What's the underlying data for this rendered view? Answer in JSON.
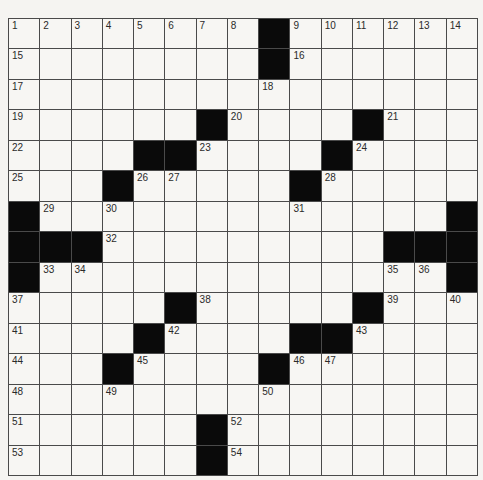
{
  "puzzle": {
    "rows": 15,
    "cols": 15,
    "colors": {
      "black_square": "#0a0a0a",
      "white_square": "#f7f6f3",
      "grid_line": "#4a4a4a",
      "number_text": "#2a2a2a"
    },
    "layout": [
      "........#......",
      "........#......",
      "...............",
      "......#....#...",
      "....##....#....",
      "...#.....#.....",
      "#.............#",
      "###.........###",
      "#.............#",
      ".....#.....#...",
      "....#....##....",
      "...#....#......",
      "...............",
      "......#........",
      "......#........"
    ],
    "numbers": [
      {
        "n": "1",
        "r": 0,
        "c": 0
      },
      {
        "n": "2",
        "r": 0,
        "c": 1
      },
      {
        "n": "3",
        "r": 0,
        "c": 2
      },
      {
        "n": "4",
        "r": 0,
        "c": 3
      },
      {
        "n": "5",
        "r": 0,
        "c": 4
      },
      {
        "n": "6",
        "r": 0,
        "c": 5
      },
      {
        "n": "7",
        "r": 0,
        "c": 6
      },
      {
        "n": "8",
        "r": 0,
        "c": 7
      },
      {
        "n": "9",
        "r": 0,
        "c": 9
      },
      {
        "n": "10",
        "r": 0,
        "c": 10
      },
      {
        "n": "11",
        "r": 0,
        "c": 11
      },
      {
        "n": "12",
        "r": 0,
        "c": 12
      },
      {
        "n": "13",
        "r": 0,
        "c": 13
      },
      {
        "n": "14",
        "r": 0,
        "c": 14
      },
      {
        "n": "15",
        "r": 1,
        "c": 0
      },
      {
        "n": "16",
        "r": 1,
        "c": 9
      },
      {
        "n": "17",
        "r": 2,
        "c": 0
      },
      {
        "n": "18",
        "r": 2,
        "c": 8
      },
      {
        "n": "19",
        "r": 3,
        "c": 0
      },
      {
        "n": "20",
        "r": 3,
        "c": 7
      },
      {
        "n": "21",
        "r": 3,
        "c": 12
      },
      {
        "n": "22",
        "r": 4,
        "c": 0
      },
      {
        "n": "23",
        "r": 4,
        "c": 6
      },
      {
        "n": "24",
        "r": 4,
        "c": 11
      },
      {
        "n": "25",
        "r": 5,
        "c": 0
      },
      {
        "n": "26",
        "r": 5,
        "c": 4
      },
      {
        "n": "27",
        "r": 5,
        "c": 5
      },
      {
        "n": "28",
        "r": 5,
        "c": 10
      },
      {
        "n": "29",
        "r": 6,
        "c": 1
      },
      {
        "n": "30",
        "r": 6,
        "c": 3
      },
      {
        "n": "31",
        "r": 6,
        "c": 9
      },
      {
        "n": "32",
        "r": 7,
        "c": 3
      },
      {
        "n": "33",
        "r": 8,
        "c": 1
      },
      {
        "n": "34",
        "r": 8,
        "c": 2
      },
      {
        "n": "35",
        "r": 8,
        "c": 12
      },
      {
        "n": "36",
        "r": 8,
        "c": 13
      },
      {
        "n": "37",
        "r": 9,
        "c": 0
      },
      {
        "n": "38",
        "r": 9,
        "c": 6
      },
      {
        "n": "39",
        "r": 9,
        "c": 12
      },
      {
        "n": "40",
        "r": 9,
        "c": 14
      },
      {
        "n": "41",
        "r": 10,
        "c": 0
      },
      {
        "n": "42",
        "r": 10,
        "c": 5
      },
      {
        "n": "43",
        "r": 10,
        "c": 11
      },
      {
        "n": "44",
        "r": 11,
        "c": 0
      },
      {
        "n": "45",
        "r": 11,
        "c": 4
      },
      {
        "n": "46",
        "r": 11,
        "c": 9
      },
      {
        "n": "47",
        "r": 11,
        "c": 10
      },
      {
        "n": "48",
        "r": 12,
        "c": 0
      },
      {
        "n": "49",
        "r": 12,
        "c": 3
      },
      {
        "n": "50",
        "r": 12,
        "c": 8
      },
      {
        "n": "51",
        "r": 13,
        "c": 0
      },
      {
        "n": "52",
        "r": 13,
        "c": 7
      },
      {
        "n": "53",
        "r": 14,
        "c": 0
      },
      {
        "n": "54",
        "r": 14,
        "c": 7
      }
    ],
    "entries": {}
  }
}
